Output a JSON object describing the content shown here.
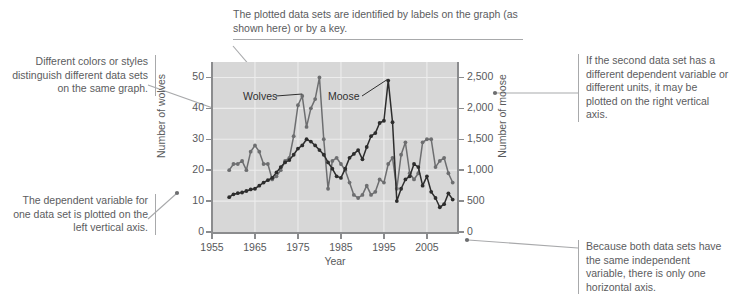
{
  "annotations": {
    "top": "The plotted data sets are identified by labels on the graph (as shown here) or by a key.",
    "left_top": "Different colors or styles distinguish different data sets on the same graph.",
    "left_bottom": "The dependent variable for one data set is plotted on the left vertical axis.",
    "right_top": "If the second data set has a different dependent variable or different units, it may be plotted on the right vertical axis.",
    "right_bottom": "Because both data sets have the same independent variable, there is only one horizontal axis."
  },
  "chart_data": {
    "type": "line",
    "title": "",
    "xlabel": "Year",
    "ylabel": "Number of wolves",
    "y2label": "Number of moose",
    "xlim": [
      1955,
      2012
    ],
    "ylim": [
      0,
      55
    ],
    "y2lim": [
      0,
      2750
    ],
    "xticks": [
      "1955",
      "1965",
      "1975",
      "1985",
      "1995",
      "2005"
    ],
    "xtick_values": [
      1955,
      1965,
      1975,
      1985,
      1995,
      2005
    ],
    "yticks": [
      "0",
      "10",
      "20",
      "30",
      "40",
      "50"
    ],
    "ytick_values": [
      0,
      10,
      20,
      30,
      40,
      50
    ],
    "y2ticks": [
      "0",
      "500",
      "1,000",
      "1,500",
      "2,000",
      "2,500"
    ],
    "y2tick_values": [
      0,
      500,
      1000,
      1500,
      2000,
      2500
    ],
    "grid": true,
    "legend": "labels-on-graph",
    "plot_background": "#d7d7d7",
    "series": [
      {
        "name": "Wolves",
        "axis": "left",
        "color": "#6d6e70",
        "marker": "circle",
        "x": [
          1959,
          1960,
          1961,
          1962,
          1963,
          1964,
          1965,
          1966,
          1967,
          1968,
          1969,
          1970,
          1971,
          1972,
          1973,
          1974,
          1975,
          1976,
          1977,
          1978,
          1979,
          1980,
          1981,
          1982,
          1983,
          1984,
          1985,
          1986,
          1987,
          1988,
          1989,
          1990,
          1991,
          1992,
          1993,
          1994,
          1995,
          1996,
          1997,
          1998,
          1999,
          2000,
          2001,
          2002,
          2003,
          2004,
          2005,
          2006,
          2007,
          2008,
          2009,
          2010,
          2011
        ],
        "values": [
          20,
          22,
          22,
          23,
          20,
          26,
          28,
          26,
          22,
          22,
          17,
          18,
          20,
          23,
          24,
          31,
          41,
          44,
          34,
          40,
          43,
          50,
          30,
          14,
          23,
          24,
          22,
          20,
          16,
          12,
          11,
          12,
          15,
          12,
          13,
          17,
          16,
          22,
          24,
          14,
          25,
          29,
          19,
          17,
          19,
          29,
          30,
          30,
          21,
          23,
          24,
          19,
          16
        ]
      },
      {
        "name": "Moose",
        "axis": "right",
        "color": "#2d2d2d",
        "marker": "circle",
        "x": [
          1959,
          1960,
          1961,
          1962,
          1963,
          1964,
          1965,
          1966,
          1967,
          1968,
          1969,
          1970,
          1971,
          1972,
          1973,
          1974,
          1975,
          1976,
          1977,
          1978,
          1979,
          1980,
          1981,
          1982,
          1983,
          1984,
          1985,
          1986,
          1987,
          1988,
          1989,
          1990,
          1991,
          1992,
          1993,
          1994,
          1995,
          1996,
          1997,
          1998,
          1999,
          2000,
          2001,
          2002,
          2003,
          2004,
          2005,
          2006,
          2007,
          2008,
          2009,
          2010,
          2011
        ],
        "values": [
          563,
          610,
          628,
          639,
          663,
          688,
          700,
          750,
          800,
          838,
          875,
          963,
          1050,
          1125,
          1163,
          1250,
          1350,
          1400,
          1500,
          1463,
          1400,
          1325,
          1250,
          1125,
          1025,
          900,
          875,
          1025,
          1200,
          1263,
          1325,
          1175,
          1375,
          1550,
          1600,
          1763,
          1800,
          2450,
          1775,
          500,
          700,
          850,
          900,
          1100,
          1050,
          750,
          900,
          650,
          550,
          400,
          450,
          625,
          525
        ]
      }
    ],
    "series_labels": [
      {
        "text": "Wolves",
        "points_to": "wolves-peak-1976"
      },
      {
        "text": "Moose",
        "points_to": "moose-peak-1996"
      }
    ]
  }
}
